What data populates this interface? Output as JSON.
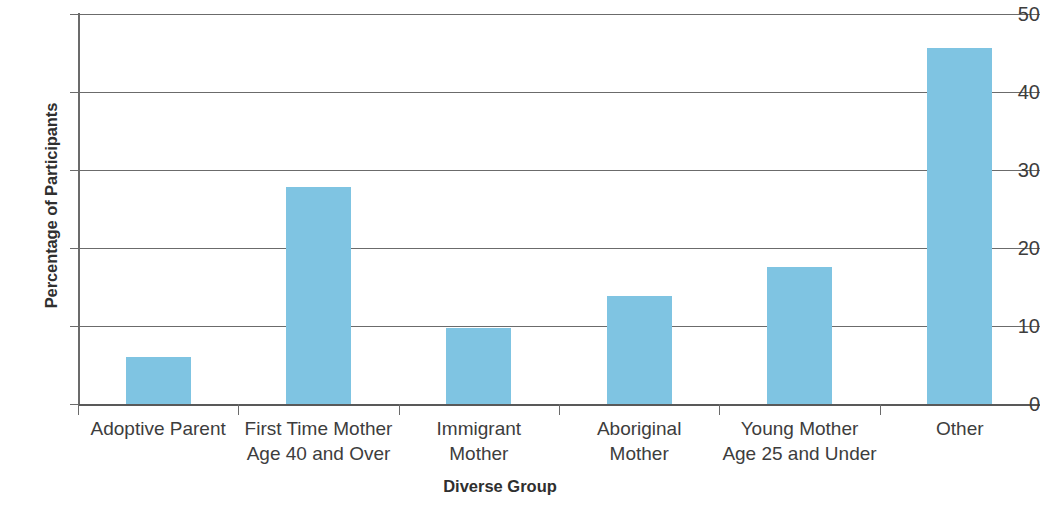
{
  "chart_data": {
    "type": "bar",
    "title": "",
    "xlabel": "Diverse Group",
    "ylabel": "Percentage of Participants",
    "categories": [
      "Adoptive Parent",
      "First Time Mother\nAge 40 and Over",
      "Immigrant\nMother",
      "Aboriginal\nMother",
      "Young Mother\nAge 25 and Under",
      "Other"
    ],
    "values": [
      6.0,
      27.8,
      9.8,
      13.9,
      17.6,
      45.6
    ],
    "ylim": [
      0,
      50
    ],
    "yticks": [
      0,
      10,
      20,
      30,
      40,
      50
    ],
    "ytick_labels": [
      "0",
      "10",
      "20",
      "30",
      "40",
      "50"
    ],
    "grid": true,
    "legend": false,
    "bar_color": "#7FC4E2",
    "axis_color": "#6b6b6b",
    "background_color": "#ffffff"
  }
}
